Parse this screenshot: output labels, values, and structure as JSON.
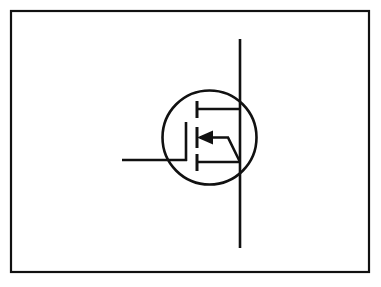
{
  "figure": {
    "background_color": "#ffffff",
    "line_color": "#111111",
    "canvas": {
      "width": 381,
      "height": 287
    },
    "frame": {
      "name": "outer-border",
      "x": 11,
      "y": 11,
      "width": 358,
      "height": 261,
      "stroke_width": 2.2
    },
    "envelope": {
      "name": "device-envelope-circle",
      "cx": 209.5,
      "cy": 137.5,
      "r": 47,
      "stroke_width": 2.6
    },
    "terminals": {
      "drain_source_line": {
        "name": "drain-source-vertical-lead",
        "x": 240,
        "y_top": 39,
        "y_bottom": 248,
        "stroke_width": 2.6
      },
      "gate_lead": {
        "name": "gate-horizontal-lead",
        "y": 160,
        "x_start": 122,
        "x_end": 187,
        "stroke_width": 2.6
      },
      "gate_bar": {
        "name": "gate-vertical-bar",
        "x": 186,
        "y_top": 122,
        "y_bottom": 161,
        "stroke_width": 2.6
      }
    },
    "channel": {
      "name": "broken-channel-bars",
      "x": 197,
      "stroke_width": 3.0,
      "segments": [
        {
          "label": "drain-segment",
          "y_top": 101,
          "y_bottom": 118
        },
        {
          "label": "body-segment",
          "y_top": 127,
          "y_bottom": 148
        },
        {
          "label": "source-segment",
          "y_top": 154,
          "y_bottom": 171
        }
      ]
    },
    "connectors": {
      "drain_connector": {
        "name": "drain-connector",
        "y": 109,
        "x_start": 197,
        "x_end": 240,
        "stroke_width": 2.6
      },
      "source_connector": {
        "name": "source-connector",
        "y": 162,
        "x_start": 197,
        "x_end": 240,
        "stroke_width": 2.6
      },
      "body_connector_path": {
        "name": "body-substrate-connector",
        "d": "M 200 137.5 L 228 137.5 L 240 162",
        "stroke_width": 2.6
      }
    },
    "arrow": {
      "name": "substrate-arrow",
      "direction": "left",
      "tip_x": 197,
      "tip_y": 137.5,
      "tail_x": 213,
      "half_height": 7,
      "points": "197,137.5 213,130.5 213,144.5"
    }
  }
}
